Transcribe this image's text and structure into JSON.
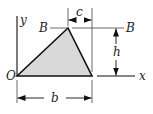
{
  "diagram": {
    "colors": {
      "fill": "#d9d9d9",
      "stroke": "#111111",
      "thin": "#333333",
      "background": "#ffffff"
    },
    "labels": {
      "origin": "O",
      "x_axis": "x",
      "y_axis": "y",
      "apex_left": "B",
      "apex_right": "B",
      "offset": "c",
      "height": "h",
      "base": "b"
    },
    "shape": {
      "type": "triangle",
      "vertices": [
        {
          "name": "O",
          "x": 17,
          "y": 76
        },
        {
          "name": "B",
          "x": 68,
          "y": 28
        },
        {
          "name": "base-right",
          "x": 92,
          "y": 76
        }
      ]
    },
    "dimensions": [
      {
        "name": "c",
        "description": "horizontal offset from apex B to base right end"
      },
      {
        "name": "h",
        "description": "height of triangle"
      },
      {
        "name": "b",
        "description": "base length"
      }
    ]
  }
}
